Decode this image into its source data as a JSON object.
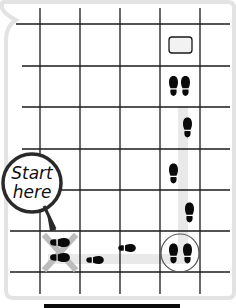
{
  "diagram": {
    "title": "",
    "grid": {
      "columns": 6,
      "rows": 7,
      "x_lines": [
        0,
        40,
        80,
        120,
        160,
        200,
        236
      ],
      "y_lines": [
        24,
        66,
        107,
        149,
        190,
        231,
        272
      ],
      "line_color": "#1a1a1a"
    },
    "callout": {
      "line1": "Start",
      "line2": "here"
    },
    "start_marker": {
      "column": 1,
      "row": 5,
      "symbol": "X",
      "color": "#bdbdbd"
    },
    "goal": {
      "column": 4,
      "row": 0,
      "shape": "rounded-rectangle"
    },
    "path": {
      "color": "#e6e6e6",
      "steps": [
        {
          "column": 1,
          "row": 5,
          "feet": "both",
          "orientation": "right"
        },
        {
          "column": 2,
          "row": 5,
          "feet": "one",
          "orientation": "right"
        },
        {
          "column": 3,
          "row": 5,
          "feet": "one",
          "orientation": "right"
        },
        {
          "column": 4,
          "row": 5,
          "feet": "both",
          "orientation": "up",
          "circled": true
        },
        {
          "column": 4,
          "row": 4,
          "feet": "one",
          "orientation": "up"
        },
        {
          "column": 4,
          "row": 3,
          "feet": "one",
          "orientation": "up"
        },
        {
          "column": 4,
          "row": 2,
          "feet": "one",
          "orientation": "up"
        },
        {
          "column": 4,
          "row": 1,
          "feet": "both",
          "orientation": "up"
        }
      ]
    },
    "colors": {
      "footprint": "#0a0a0a",
      "border": "#e3e3e3",
      "bottom_bar": "#0a0a0a"
    }
  }
}
